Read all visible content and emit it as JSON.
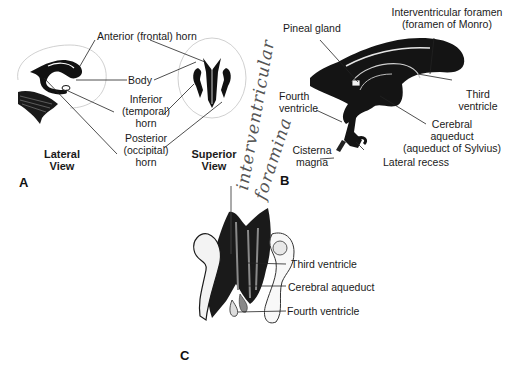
{
  "panels": {
    "A": {
      "letter": "A",
      "view_labels": {
        "lateral": "Lateral\nView",
        "lateral_l1": "Lateral",
        "lateral_l2": "View",
        "superior_l1": "Superior",
        "superior_l2": "View"
      },
      "labels": {
        "anterior_horn": "Anterior (frontal) horn",
        "body": "Body",
        "inferior_l1": "Inferior",
        "inferior_l2": "(temporal)",
        "inferior_l3": "horn",
        "posterior_l1": "Posterior",
        "posterior_l2": "(occipital)",
        "posterior_l3": "horn"
      }
    },
    "B": {
      "letter": "B",
      "labels": {
        "pineal": "Pineal gland",
        "iv_foramen_l1": "Interventricular foramen",
        "iv_foramen_l2": "(foramen of Monro)",
        "third_l1": "Third",
        "third_l2": "ventricle",
        "fourth_l1": "Fourth",
        "fourth_l2": "ventricle",
        "aqueduct_l1": "Cerebral",
        "aqueduct_l2": "aqueduct",
        "aqueduct_l3": "(aqueduct of Sylvius)",
        "cisterna_l1": "Cisterna",
        "cisterna_l2": "magna",
        "lateral_recess": "Lateral recess"
      }
    },
    "C": {
      "letter": "C",
      "labels": {
        "third": "Third ventricle",
        "aqueduct": "Cerebral aqueduct",
        "fourth": "Fourth ventricle"
      }
    }
  },
  "handwritten": {
    "line1": "interventricular",
    "line2": "foramina"
  },
  "colors": {
    "ink": "#111111",
    "outline": "#b8b8b8",
    "background": "#ffffff",
    "pencil": "#555555"
  }
}
